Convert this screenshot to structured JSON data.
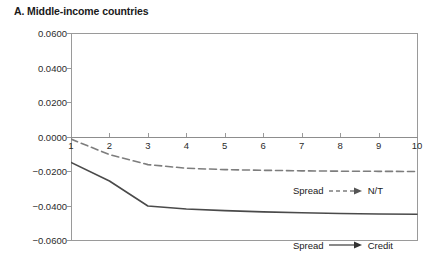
{
  "chart_data": {
    "type": "line",
    "title": "A. Middle-income countries",
    "xlabel": "",
    "ylabel": "",
    "x": [
      1,
      2,
      3,
      4,
      5,
      6,
      7,
      8,
      9,
      10
    ],
    "xlim": [
      1,
      10
    ],
    "ylim": [
      -0.06,
      0.06
    ],
    "yticks": [
      "0.0600",
      "0.0400",
      "0.0200",
      "0.0000",
      "-0.0200",
      "-0.0400",
      "-0.0600"
    ],
    "ytick_values": [
      0.06,
      0.04,
      0.02,
      0.0,
      -0.02,
      -0.04,
      -0.06
    ],
    "xticks": [
      "1",
      "2",
      "3",
      "4",
      "5",
      "6",
      "7",
      "8",
      "9",
      "10"
    ],
    "grid": false,
    "legend_position": "inside-right",
    "series": [
      {
        "name": "N/T",
        "legend_prefix": "Spread",
        "style": "dashed",
        "color": "#7d7d7d",
        "values": [
          -0.0015,
          -0.0105,
          -0.0163,
          -0.0184,
          -0.0192,
          -0.0196,
          -0.0199,
          -0.0201,
          -0.0202,
          -0.0203
        ]
      },
      {
        "name": "Credit",
        "legend_prefix": "Spread",
        "style": "solid",
        "color": "#4a4a4a",
        "values": [
          -0.015,
          -0.0258,
          -0.0403,
          -0.042,
          -0.043,
          -0.0437,
          -0.0442,
          -0.0446,
          -0.0449,
          -0.0451
        ]
      }
    ]
  },
  "legend": {
    "nt": {
      "prefix": "Spread",
      "label": "N/T"
    },
    "credit": {
      "prefix": "Spread",
      "label": "Credit"
    }
  }
}
